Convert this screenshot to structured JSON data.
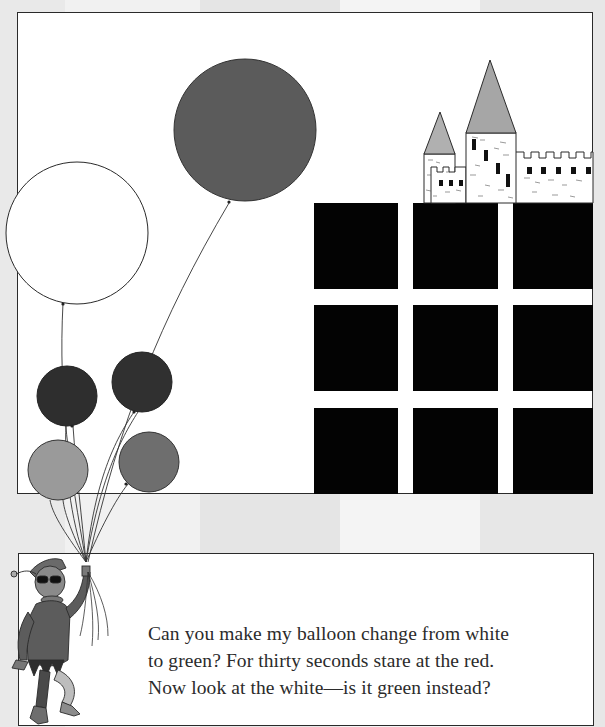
{
  "illustration": {
    "title": "Color afterimage balloon illusion",
    "background_stripes": [
      "#e9e9e9",
      "#f1f1f1",
      "#e5e5e5",
      "#f4f4f4",
      "#e7e7e7"
    ],
    "balloons": [
      {
        "name": "white-balloon",
        "color": "#ffffff",
        "cx": 77,
        "cy": 233,
        "r": 71
      },
      {
        "name": "red-balloon",
        "color": "#5b5b5b",
        "cx": 245,
        "cy": 130,
        "r": 71
      },
      {
        "name": "dark-balloon-left",
        "color": "#2e2e2e",
        "cx": 67,
        "cy": 396,
        "r": 30
      },
      {
        "name": "dark-balloon-right",
        "color": "#303030",
        "cx": 142,
        "cy": 382,
        "r": 30
      },
      {
        "name": "light-balloon-left",
        "color": "#9a9a9a",
        "cx": 58,
        "cy": 470,
        "r": 30
      },
      {
        "name": "medium-balloon-right",
        "color": "#6e6e6e",
        "cx": 149,
        "cy": 462,
        "r": 30
      }
    ],
    "grid": {
      "color": "#030303",
      "columns": [
        314,
        413,
        513
      ],
      "rows": [
        203,
        305,
        408
      ],
      "size": 85
    },
    "castle": {
      "roof_color": "#a8a8a8",
      "wall_color": "#ffffff"
    }
  },
  "caption": {
    "lines": [
      "Can you make my balloon change from white",
      "to green? For thirty seconds stare at the red.",
      "Now look at the white—is it green instead?"
    ]
  }
}
